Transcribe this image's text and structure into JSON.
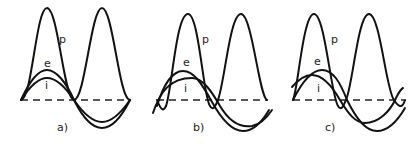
{
  "figure": {
    "curve_labels": {
      "power": "p",
      "voltage": "e",
      "current": "i"
    },
    "panels": [
      {
        "id": "a",
        "caption": "a)",
        "phase_relation": "in phase"
      },
      {
        "id": "b",
        "caption": "b)",
        "phase_relation": "current lags voltage (small angle)"
      },
      {
        "id": "c",
        "caption": "c)",
        "phase_relation": "current leads voltage"
      }
    ]
  }
}
